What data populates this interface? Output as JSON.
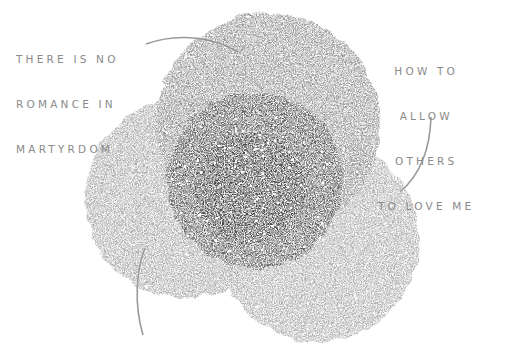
{
  "diagram": {
    "type": "venn-illustration",
    "labels": {
      "top_left": [
        "THERE IS NO",
        "ROMANCE IN",
        "MARTYRDOM"
      ],
      "top_right": [
        "HOW TO",
        "ALLOW",
        "OTHERS",
        "TO LOVE ME"
      ]
    },
    "circles": [
      {
        "name": "top",
        "cx": 268,
        "cy": 125,
        "r": 112,
        "color": "#8d8d8d"
      },
      {
        "name": "left",
        "cx": 185,
        "cy": 198,
        "r": 100,
        "color": "#a3a3a3"
      },
      {
        "name": "right",
        "cx": 318,
        "cy": 240,
        "r": 102,
        "color": "#a6a6a6"
      },
      {
        "name": "center",
        "cx": 255,
        "cy": 180,
        "r": 88,
        "color": "#555555"
      }
    ],
    "colors": {
      "background": "#ffffff",
      "label_text": "#8a8a8a",
      "pointer_line": "#9a9a9a",
      "star_dots": "#ffffff"
    }
  }
}
